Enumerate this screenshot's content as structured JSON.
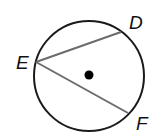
{
  "diagram": {
    "type": "circle-inscribed-angle",
    "points": [
      {
        "id": "E",
        "label": "E"
      },
      {
        "id": "D",
        "label": "D"
      },
      {
        "id": "F",
        "label": "F"
      }
    ],
    "chords": [
      {
        "from": "E",
        "to": "D"
      },
      {
        "from": "E",
        "to": "F"
      }
    ],
    "center_marker": "dot",
    "colors": {
      "circle": "#1a1a1a",
      "chord": "#6b6b6b",
      "dot": "#000000"
    }
  }
}
